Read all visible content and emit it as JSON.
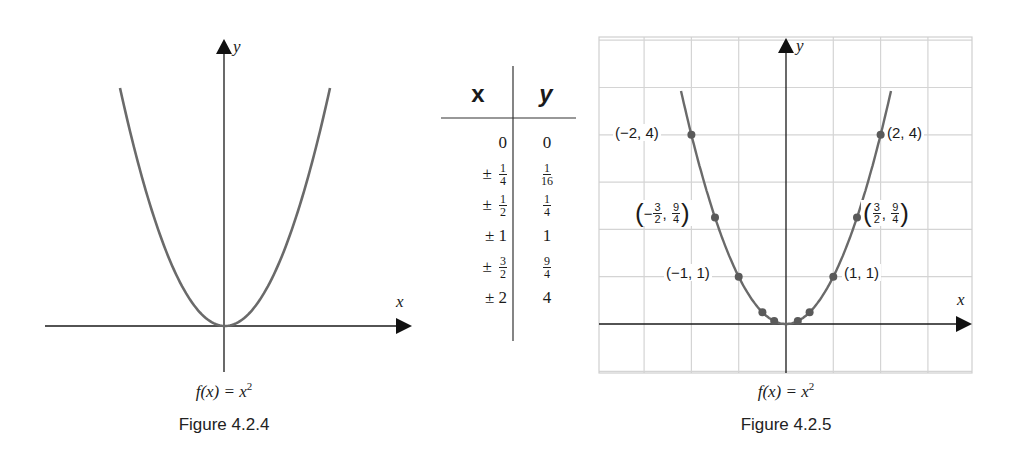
{
  "figures": [
    {
      "id": "fig-4-2-4",
      "function_label": "f(x) = x",
      "exponent": "2",
      "caption": "Figure 4.2.4",
      "axis_labels": {
        "x": "x",
        "y": "y"
      }
    },
    {
      "id": "fig-4-2-5",
      "function_label": "f(x) = x",
      "exponent": "2",
      "caption": "Figure 4.2.5",
      "axis_labels": {
        "x": "x",
        "y": "y"
      },
      "point_labels": {
        "p_neg2": "(−2, 4)",
        "p_pos2": "(2, 4)",
        "p_neg1": "(−1, 1)",
        "p_pos1": "(1, 1)",
        "p_neg32": {
          "sign": "−",
          "x_num": "3",
          "x_den": "2",
          "y_num": "9",
          "y_den": "4"
        },
        "p_pos32": {
          "sign": "",
          "x_num": "3",
          "x_den": "2",
          "y_num": "9",
          "y_den": "4"
        }
      }
    }
  ],
  "table": {
    "headers": {
      "x": "x",
      "y": "y"
    },
    "rows": [
      {
        "x_prefix": "",
        "x_whole": "0",
        "x_num": "",
        "x_den": "",
        "y_whole": "0",
        "y_num": "",
        "y_den": ""
      },
      {
        "x_prefix": "±",
        "x_whole": "",
        "x_num": "1",
        "x_den": "4",
        "y_whole": "",
        "y_num": "1",
        "y_den": "16"
      },
      {
        "x_prefix": "±",
        "x_whole": "",
        "x_num": "1",
        "x_den": "2",
        "y_whole": "",
        "y_num": "1",
        "y_den": "4"
      },
      {
        "x_prefix": "±",
        "x_whole": "1",
        "x_num": "",
        "x_den": "",
        "y_whole": "1",
        "y_num": "",
        "y_den": ""
      },
      {
        "x_prefix": "±",
        "x_whole": "",
        "x_num": "3",
        "x_den": "2",
        "y_whole": "",
        "y_num": "9",
        "y_den": "4"
      },
      {
        "x_prefix": "±",
        "x_whole": "2",
        "x_num": "",
        "x_den": "",
        "y_whole": "4",
        "y_num": "",
        "y_den": ""
      }
    ]
  },
  "chart_data": [
    {
      "type": "line",
      "title": "Figure 4.2.4",
      "subtitle": "f(x) = x^2",
      "xlabel": "x",
      "ylabel": "y",
      "grid": false,
      "x": [
        -2.2,
        -2,
        -1.5,
        -1,
        -0.5,
        0,
        0.5,
        1,
        1.5,
        2,
        2.2
      ],
      "y": [
        4.84,
        4,
        2.25,
        1,
        0.25,
        0,
        0.25,
        1,
        2.25,
        4,
        4.84
      ]
    },
    {
      "type": "scatter",
      "title": "Figure 4.2.5",
      "subtitle": "f(x) = x^2",
      "xlabel": "x",
      "ylabel": "y",
      "grid": true,
      "xlim": [
        -4,
        4
      ],
      "ylim": [
        -1,
        6
      ],
      "x": [
        -2,
        -1.5,
        -1,
        -0.5,
        -0.25,
        0,
        0.25,
        0.5,
        1,
        1.5,
        2
      ],
      "y": [
        4,
        2.25,
        1,
        0.25,
        0.0625,
        0,
        0.0625,
        0.25,
        1,
        2.25,
        4
      ],
      "annotations": [
        "(-2, 4)",
        "(2, 4)",
        "(-3/2, 9/4)",
        "(3/2, 9/4)",
        "(-1, 1)",
        "(1, 1)"
      ]
    }
  ],
  "colors": {
    "curve": "#6a6a6a",
    "axis": "#1a1a1a",
    "grid": "#d4d4d4",
    "point": "#5a5a5a"
  }
}
